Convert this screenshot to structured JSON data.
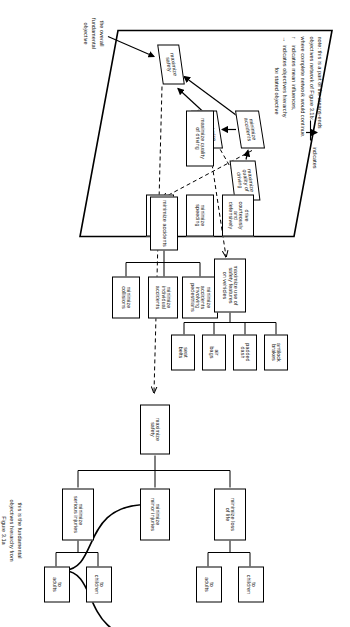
{
  "figure": {
    "note": {
      "lines": [
        "note: this is a part of the means-ends",
        "objectives network of Figure 3.1b:",
        "where complete network would continue."
      ],
      "legend_arrow_line": "indicates",
      "legend_solid": "indicates mean influences,",
      "legend_dashed": "indicates objectives hierarchy",
      "legend_dashed_2": "for stated objective"
    },
    "caption_bottom": {
      "lines": [
        "this is the fundamental",
        "objectives hierarchy from",
        "Figure 3.1a"
      ]
    },
    "label_overall": {
      "lines": [
        "the overall",
        "fundamental",
        "objective"
      ]
    }
  },
  "plane_boxes": {
    "maximize_safety": "maximize\nsafety",
    "maximize_safety_features": "maximize\nsafety\nfeatures",
    "minimize_accidents": "minimize\naccidents",
    "maximize_quality_of_driving": "maximize\nquality of\ndriving"
  },
  "means_ends": {
    "root": {
      "label": "maximize\nsafety"
    },
    "branches": [
      {
        "label": "maximize use of\nsafety features\non vehicles",
        "children": [
          {
            "label": "antilock\nbrakes"
          },
          {
            "label": "padded\ndash"
          },
          {
            "label": "air\nbags"
          },
          {
            "label": "seat\nbelts"
          }
        ]
      },
      {
        "label": "minimize accidents",
        "children": [
          {
            "label": "minimize\naccidents\ninvolving\npedestrians"
          },
          {
            "label": "minimize\nindividual\naccidents"
          },
          {
            "label": "minimize\ncollisions"
          }
        ]
      },
      {
        "label": "maximize quality\nof driving",
        "children": [
          {
            "label": "drive\ncourteously\nand\ndefensively"
          },
          {
            "label": "minimize\nspeeding"
          },
          {
            "label": "know other\nvehicle laws"
          }
        ]
      }
    ]
  },
  "fundamental_hierarchy": {
    "root": {
      "label": "maximize\nsafety"
    },
    "branches": [
      {
        "label": "minimize loss\nof life",
        "children": [
          {
            "label": "to\nchildren"
          },
          {
            "label": "to\nadults"
          }
        ]
      },
      {
        "label": "minimize\nminor injuries",
        "children": []
      },
      {
        "label": "minimize\nserious injuries",
        "children": [
          {
            "label": "to\nchildren"
          },
          {
            "label": "to\nadults"
          }
        ]
      }
    ]
  },
  "colors": {
    "ink": "#000000",
    "paper": "#ffffff"
  }
}
